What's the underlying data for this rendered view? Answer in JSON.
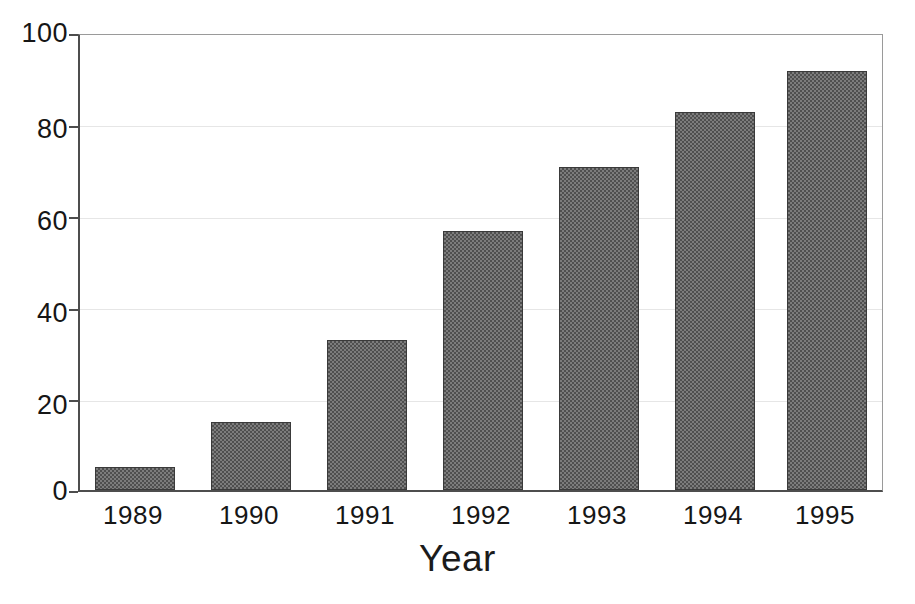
{
  "chart_data": {
    "type": "bar",
    "title": "",
    "subtitle": "",
    "xlabel": "Year",
    "ylabel": "",
    "categories": [
      "1989",
      "1990",
      "1991",
      "1992",
      "1993",
      "1994",
      "1995"
    ],
    "values": [
      5,
      15,
      33,
      57,
      71,
      83,
      92
    ],
    "series": [
      {
        "name": "",
        "values": [
          5,
          15,
          33,
          57,
          71,
          83,
          92
        ]
      }
    ],
    "ylim": [
      0,
      100
    ],
    "y_ticks": [
      0,
      20,
      40,
      60,
      80,
      100
    ],
    "y_tick_labels": [
      "0",
      "20",
      "40",
      "60",
      "80",
      "100"
    ],
    "x_tick_labels": [
      "1989",
      "1990",
      "1991",
      "1992",
      "1993",
      "1994",
      "1995"
    ],
    "grid": "horizontal-faint",
    "legend": "none",
    "annotations": [],
    "colors": {
      "bar_fill": "#7c7c7c",
      "bar_pattern_dark": "#4f4f4f",
      "bar_border": "#3a3a3a",
      "axis": "#4d4d4d",
      "gridline": "#e6e6e6",
      "text": "#161616",
      "background": "#ffffff"
    }
  }
}
